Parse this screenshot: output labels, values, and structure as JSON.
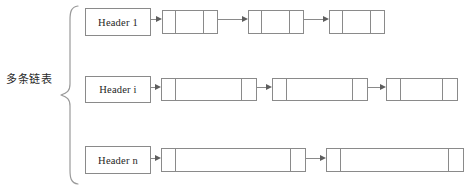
{
  "diagram": {
    "group_label": "多条链表",
    "rows": [
      {
        "header": "Header 1",
        "header_box": {
          "x": 85,
          "y": 8,
          "w": 66,
          "h": 28
        },
        "nodes": [
          {
            "x": 162,
            "y": 10,
            "w": 56,
            "h": 24,
            "cells": [
              12,
              30,
              14
            ]
          },
          {
            "x": 248,
            "y": 10,
            "w": 56,
            "h": 24,
            "cells": [
              12,
              30,
              14
            ]
          },
          {
            "x": 329,
            "y": 10,
            "w": 56,
            "h": 24,
            "cells": [
              12,
              30,
              14
            ]
          }
        ],
        "arrows": [
          {
            "x": 151,
            "y": 19,
            "w": 11
          },
          {
            "x": 218,
            "y": 19,
            "w": 30
          },
          {
            "x": 304,
            "y": 19,
            "w": 25
          }
        ]
      },
      {
        "header": "Header i",
        "header_box": {
          "x": 85,
          "y": 76,
          "w": 66,
          "h": 27
        },
        "nodes": [
          {
            "x": 161,
            "y": 78,
            "w": 96,
            "h": 23,
            "cells": [
              13,
              68,
              15
            ]
          },
          {
            "x": 272,
            "y": 78,
            "w": 96,
            "h": 23,
            "cells": [
              13,
              68,
              15
            ]
          },
          {
            "x": 386,
            "y": 78,
            "w": 72,
            "h": 23,
            "cells": [
              13,
              44,
              15
            ]
          }
        ],
        "arrows": [
          {
            "x": 151,
            "y": 87,
            "w": 10
          },
          {
            "x": 257,
            "y": 87,
            "w": 15
          },
          {
            "x": 368,
            "y": 87,
            "w": 18
          }
        ]
      },
      {
        "header": "Header n",
        "header_box": {
          "x": 85,
          "y": 146,
          "w": 66,
          "h": 28
        },
        "nodes": [
          {
            "x": 161,
            "y": 148,
            "w": 145,
            "h": 24,
            "cells": [
              13,
              117,
              15
            ]
          },
          {
            "x": 326,
            "y": 148,
            "w": 138,
            "h": 24,
            "cells": [
              13,
              110,
              15
            ]
          }
        ],
        "arrows": [
          {
            "x": 151,
            "y": 158,
            "w": 10
          },
          {
            "x": 306,
            "y": 158,
            "w": 20
          }
        ]
      }
    ]
  },
  "colors": {
    "stroke": "#8a8a8a",
    "arrow_head": "#5e5e5e",
    "text": "#1e1e1e",
    "background": "#ffffff"
  }
}
